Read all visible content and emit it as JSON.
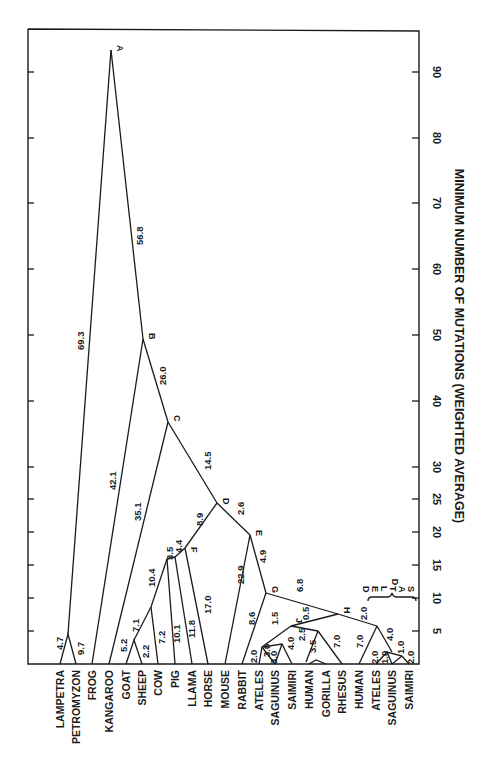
{
  "figure": {
    "axis_title": "MINIMUM NUMBER OF MUTATIONS (WEIGHTED AVERAGE)",
    "axis_ticks": [
      "5",
      "10",
      "15",
      "20",
      "25",
      "30",
      "40",
      "50",
      "60",
      "70",
      "80",
      "90"
    ],
    "axis_tick_values": [
      5,
      10,
      15,
      20,
      25,
      30,
      40,
      50,
      60,
      70,
      80,
      90
    ],
    "deltas_label": [
      "D",
      "E",
      "L",
      "T",
      "A",
      "S"
    ],
    "taxa": [
      "LAMPETRA",
      "PETROMYZON",
      "FROG",
      "KANGAROO",
      "GOAT",
      "SHEEP",
      "COW",
      "PIG",
      "LLAMA",
      "HORSE",
      "MOUSE",
      "RABBIT",
      "ATELES",
      "SAGUINUS",
      "SAIMIRI",
      "HUMAN",
      "GORILLA",
      "RHESUS",
      "HUMAN",
      "ATELES",
      "SAGUINUS",
      "SAIMIRI"
    ],
    "node_labels": [
      "A",
      "B",
      "C",
      "D",
      "E",
      "F",
      "G",
      "H",
      "J"
    ],
    "branch_lengths": [
      "4.7",
      "9.7",
      "69.3",
      "56.8",
      "42.1",
      "26.0",
      "35.1",
      "14.5",
      "5.2",
      "2.2",
      "7.1",
      "7.2",
      "10.4",
      "10.1",
      "3.5",
      "11.8",
      "4.4",
      "17.0",
      "8.9",
      "2.6",
      "22.9",
      "4.9",
      "8.6",
      "6.8",
      "2.0",
      "3.0",
      "3.0",
      "1.5",
      "4.0",
      "0.5",
      "2.5",
      "3.5",
      "7.0",
      "2.0",
      "7.0",
      "2.0",
      "4.0",
      "1.0",
      "1.0",
      "2.0"
    ]
  }
}
